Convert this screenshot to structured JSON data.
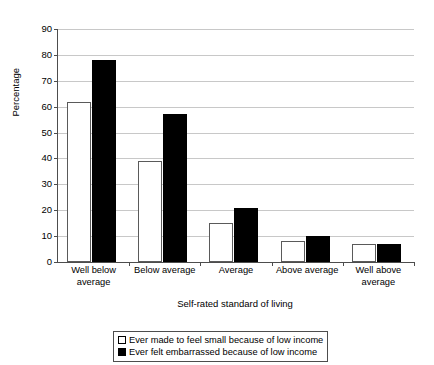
{
  "chart_data": {
    "type": "bar",
    "title": "",
    "xlabel": "Self-rated standard of living",
    "ylabel": "Percentage",
    "ylim": [
      0,
      90
    ],
    "ytick_step": 10,
    "yticks": [
      0,
      10,
      20,
      30,
      40,
      50,
      60,
      70,
      80,
      90
    ],
    "grid": true,
    "legend_position": "bottom",
    "categories": [
      "Well below average",
      "Below average",
      "Average",
      "Above average",
      "Well above average"
    ],
    "series": [
      {
        "name": "Ever made to feel small because of low income",
        "color": "#ffffff",
        "edge_color": "#000000",
        "values": [
          62,
          39,
          15,
          8,
          7
        ]
      },
      {
        "name": "Ever felt embarrassed because of low income",
        "color": "#000000",
        "edge_color": "#000000",
        "values": [
          78,
          57,
          21,
          10,
          7
        ]
      }
    ]
  },
  "legend": {
    "entries": [
      {
        "label": "Ever made to feel small because of low income"
      },
      {
        "label": "Ever felt embarrassed because of low income"
      }
    ]
  },
  "colors": {
    "axis": "#4d4d4d",
    "grid": "#c8c8c8",
    "series_white": "#ffffff",
    "series_black": "#000000"
  }
}
